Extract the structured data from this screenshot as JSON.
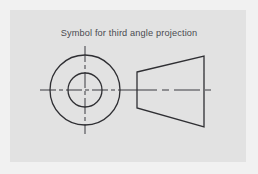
{
  "figure": {
    "title": "Symbol for third angle projection",
    "title_position": {
      "x": 129,
      "y": 36
    },
    "panel": {
      "x": 10,
      "y": 10,
      "width": 236,
      "height": 152,
      "fill": "#e2e2e2",
      "page_background": "#f1f1f1"
    },
    "line_color": "#2f2f33",
    "centerline_color": "#3b3b40",
    "stroke_width": 1.3,
    "centerline_width": 1.0,
    "views": {
      "front_view": {
        "name": "concentric-circles",
        "center": {
          "cx": 85,
          "cy": 90
        },
        "outer_circle_radius": 35,
        "inner_circle_radius": 17,
        "horizontal_centerline": {
          "x1": 40,
          "y1": 90,
          "x2": 131,
          "y2": 90
        },
        "vertical_centerline": {
          "x1": 85,
          "y1": 46,
          "x2": 85,
          "y2": 134
        }
      },
      "side_view": {
        "name": "truncated-cone-trapezoid",
        "points": [
          {
            "x": 137,
            "y": 72
          },
          {
            "x": 204,
            "y": 56
          },
          {
            "x": 204,
            "y": 127
          },
          {
            "x": 137,
            "y": 108
          }
        ],
        "axis_centerline": {
          "x1": 131,
          "y1": 90,
          "x2": 211,
          "y2": 90
        },
        "axis_dash_pattern": "14 4 5 4"
      }
    }
  }
}
